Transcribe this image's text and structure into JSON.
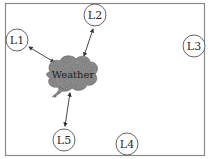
{
  "diagram": {
    "type": "star-network",
    "center": {
      "id": "weather",
      "label": "Weather",
      "shape": "cloud"
    },
    "nodes": [
      {
        "id": "L1",
        "label": "L1",
        "connected": true
      },
      {
        "id": "L2",
        "label": "L2",
        "connected": true
      },
      {
        "id": "L3",
        "label": "L3",
        "connected": false
      },
      {
        "id": "L4",
        "label": "L4",
        "connected": false
      },
      {
        "id": "L5",
        "label": "L5",
        "connected": true
      }
    ],
    "edges": [
      {
        "from": "weather",
        "to": "L1",
        "direction": "bidirectional"
      },
      {
        "from": "weather",
        "to": "L2",
        "direction": "bidirectional"
      },
      {
        "from": "weather",
        "to": "L5",
        "direction": "bidirectional"
      }
    ],
    "colors": {
      "frame": "#8a8a8a",
      "circle_stroke": "#555555",
      "cloud_fill": "#9a9a9a",
      "arrow": "#333333",
      "text": "#2a2a2a"
    }
  }
}
